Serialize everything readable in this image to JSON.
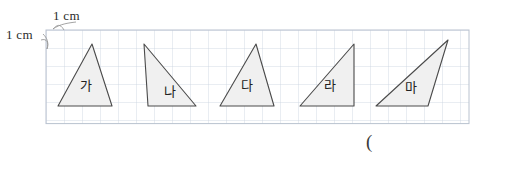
{
  "worksheet": {
    "scale_label_horizontal": "1 cm",
    "scale_label_vertical": "1 cm",
    "answer_blank": "(",
    "grid": {
      "cell_size_cm": 1,
      "cell_size_px": 18,
      "origin_x": 46,
      "origin_y": 30,
      "cols": 23.5,
      "rows": 5.2,
      "line_color": "#c9d3e0",
      "border_color": "#b9c2cf"
    },
    "shape_style": {
      "fill": "#f0f0f0",
      "stroke": "#4a4a4a",
      "stroke_width": 1.1
    },
    "shapes": [
      {
        "label": "가",
        "kind": "triangle",
        "points": "58,106 112,106 92,44",
        "label_x": 86,
        "label_y": 90
      },
      {
        "label": "나",
        "kind": "triangle",
        "points": "148,106 196,106 144,44",
        "label_x": 170,
        "label_y": 96
      },
      {
        "label": "다",
        "kind": "triangle",
        "points": "220,106 274,106 256,44",
        "label_x": 247,
        "label_y": 90
      },
      {
        "label": "라",
        "kind": "triangle",
        "points": "300,106 354,106 354,44",
        "label_x": 330,
        "label_y": 90
      },
      {
        "label": "마",
        "kind": "triangle",
        "points": "376,106 428,106 448,40",
        "label_x": 411,
        "label_y": 92
      }
    ]
  }
}
